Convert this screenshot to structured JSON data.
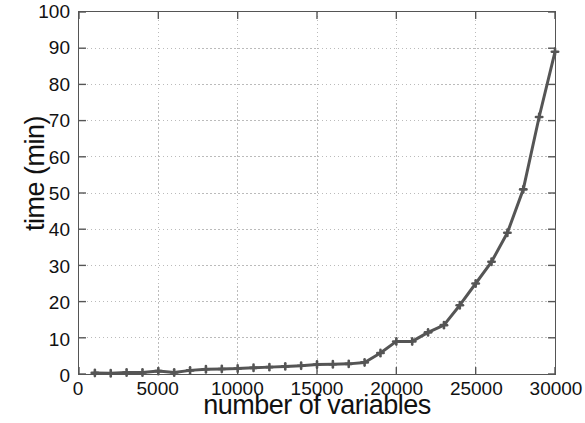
{
  "chart_data": {
    "type": "line",
    "title": "",
    "xlabel": "number of variables",
    "ylabel": "time (min)",
    "xlim": [
      0,
      30000
    ],
    "ylim": [
      0,
      100
    ],
    "xticks": [
      0,
      5000,
      10000,
      15000,
      20000,
      25000,
      30000
    ],
    "yticks": [
      0,
      10,
      20,
      30,
      40,
      50,
      60,
      70,
      80,
      90,
      100
    ],
    "grid": true,
    "legend": null,
    "series": [
      {
        "name": "solve time",
        "color": "#555555",
        "marker": "plus",
        "x": [
          1000,
          2000,
          3000,
          4000,
          5000,
          6000,
          7000,
          8000,
          9000,
          10000,
          11000,
          12000,
          13000,
          14000,
          15000,
          16000,
          17000,
          18000,
          19000,
          20000,
          21000,
          22000,
          23000,
          24000,
          25000,
          26000,
          27000,
          28000,
          29000,
          30000
        ],
        "values": [
          0.3,
          0.2,
          0.4,
          0.4,
          0.8,
          0.4,
          1.0,
          1.3,
          1.4,
          1.5,
          1.7,
          1.9,
          2.1,
          2.3,
          2.6,
          2.7,
          2.8,
          3.2,
          5.8,
          9.0,
          9.0,
          11.5,
          13.5,
          19.0,
          25.0,
          31.0,
          39.0,
          51.0,
          71.0,
          89.0
        ]
      }
    ]
  },
  "axes": {
    "x_tick_labels": [
      "0",
      "5000",
      "10000",
      "15000",
      "20000",
      "25000",
      "30000"
    ],
    "y_tick_labels": [
      "0",
      "10",
      "20",
      "30",
      "40",
      "50",
      "60",
      "70",
      "80",
      "90",
      "100"
    ]
  },
  "style": {
    "line_color": "#555555",
    "grid_color": "#bbbbbb",
    "axis_color": "#555555",
    "text_color": "#111111",
    "background": "#ffffff"
  }
}
